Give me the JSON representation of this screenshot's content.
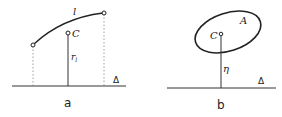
{
  "panels": [
    {
      "id": "a",
      "caption": "a",
      "curve_label": "l",
      "centroid_label": "C",
      "distance_label": "r",
      "distance_subscript": "l",
      "axis_label": "Δ"
    },
    {
      "id": "b",
      "caption": "b",
      "area_label": "A",
      "centroid_label": "C",
      "distance_label": "η",
      "axis_label": "Δ"
    }
  ],
  "colors": {
    "stroke": "#222222",
    "background": "#ffffff"
  }
}
